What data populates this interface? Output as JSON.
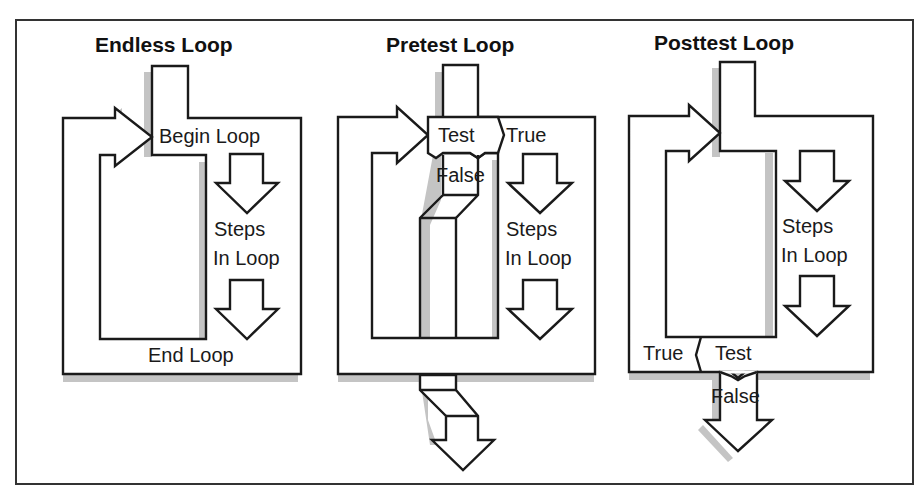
{
  "figure": {
    "panels": [
      {
        "title": "Endless Loop",
        "labels": {
          "begin": "Begin Loop",
          "steps_line1": "Steps",
          "steps_line2": "In Loop",
          "end": "End Loop"
        }
      },
      {
        "title": "Pretest Loop",
        "labels": {
          "test": "Test",
          "true": "True",
          "false": "False",
          "steps_line1": "Steps",
          "steps_line2": "In Loop"
        }
      },
      {
        "title": "Posttest Loop",
        "labels": {
          "steps_line1": "Steps",
          "steps_line2": "In Loop",
          "true": "True",
          "test": "Test",
          "false": "False"
        }
      }
    ],
    "colors": {
      "stroke": "#1a1a1a",
      "shadow": "#c4c4c4",
      "fill": "#ffffff"
    }
  }
}
